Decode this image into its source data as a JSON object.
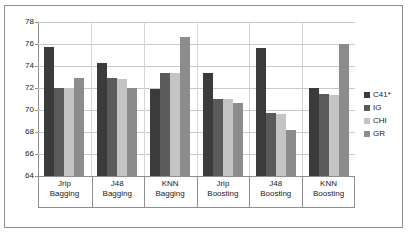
{
  "chart_data": {
    "type": "bar",
    "title": "",
    "xlabel": "",
    "ylabel": "",
    "ylim": [
      64,
      78
    ],
    "ytick_step": 2,
    "yticks": [
      78,
      76,
      74,
      72,
      70,
      68,
      66,
      64
    ],
    "grid": true,
    "legend_position": "right",
    "categories": [
      "Jrip\nBagging",
      "J48\nBagging",
      "KNN\nBagging",
      "Jrip\nBoosting",
      "J48\nBoosting",
      "KNN\nBoosting"
    ],
    "category_lines": [
      [
        "Jrip",
        "Bagging"
      ],
      [
        "J48",
        "Bagging"
      ],
      [
        "KNN",
        "Bagging"
      ],
      [
        "Jrip",
        "Boosting"
      ],
      [
        "J48",
        "Boosting"
      ],
      [
        "KNN",
        "Boosting"
      ]
    ],
    "series": [
      {
        "name": "C41*",
        "color": "#3b3b3b",
        "values": [
          75.7,
          74.3,
          71.9,
          73.4,
          75.6,
          72.0
        ]
      },
      {
        "name": "IG",
        "color": "#5a5a5a",
        "values": [
          72.0,
          72.9,
          73.4,
          71.0,
          69.7,
          71.5
        ]
      },
      {
        "name": "CHI",
        "color": "#c4c4c4",
        "values": [
          72.0,
          72.85,
          73.35,
          71.0,
          69.6,
          71.4
        ]
      },
      {
        "name": "GR",
        "color": "#8c8c8c",
        "values": [
          72.9,
          72.0,
          76.6,
          70.6,
          68.2,
          76.0
        ]
      }
    ]
  },
  "legend": {
    "items": [
      {
        "label": "C41*",
        "color": "#3b3b3b"
      },
      {
        "label": "IG",
        "color": "#5a5a5a"
      },
      {
        "label": "CHI",
        "color": "#c4c4c4"
      },
      {
        "label": "GR",
        "color": "#8c8c8c"
      }
    ]
  },
  "axis": {
    "y_tick_labels": [
      "78",
      "76",
      "74",
      "72",
      "70",
      "68",
      "66",
      "64"
    ]
  }
}
